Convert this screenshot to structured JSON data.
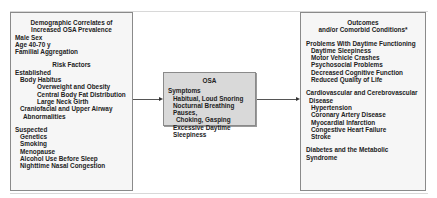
{
  "left_box": {
    "title_lines": [
      "Demographic Correlates of",
      "Increased OSA Prevalence"
    ],
    "demographics": [
      "Male Sex",
      "Age 40-70 y",
      "Familial Aggregation"
    ],
    "risk_title": "Risk Factors",
    "established_label": "Established",
    "body_habitus_label": "Body Habitus",
    "body_habitus_items": [
      "Overweight and Obesity",
      "Central Body Fat Distribution",
      "Large Neck Girth"
    ],
    "craniofacial": [
      "Craniofacial and Upper Airway",
      "Abnormalities"
    ],
    "suspected_label": "Suspected",
    "suspected_items": [
      "Genetics",
      "Smoking",
      "Menopause",
      "Alcohol Use Before Sleep",
      "Nighttime Nasal Congestion"
    ]
  },
  "center_box": {
    "title": "OSA",
    "symptoms_label": "Symptoms",
    "symptoms": [
      "Habitual, Loud Snoring",
      "Nocturnal Breathing Pauses,",
      "Choking, Gasping",
      "Excessive Daytime Sleepiness"
    ]
  },
  "right_box": {
    "title_lines": [
      "Outcomes",
      "and/or Comorbid Conditions*"
    ],
    "daytime_label": "Problems With Daytime Functioning",
    "daytime_items": [
      "Daytime Sleepiness",
      "Motor Vehicle Crashes",
      "Psychosocial Problems",
      "Decreased Cognitive Function",
      "Reduced Quality of Life"
    ],
    "cardio_label_lines": [
      "Cardiovascular and Cerebrovascular",
      "Disease"
    ],
    "cardio_items": [
      "Hypertension",
      "Coronary Artery Disease",
      "Myocardial Infarction",
      "Congestive Heart Failure",
      "Stroke"
    ],
    "diabetes_label": "Diabetes and the Metabolic Syndrome"
  },
  "colors": {
    "box_fill": "#f6f6f6",
    "center_fill": "#d9d9d9",
    "border": "#8a8a8a"
  }
}
